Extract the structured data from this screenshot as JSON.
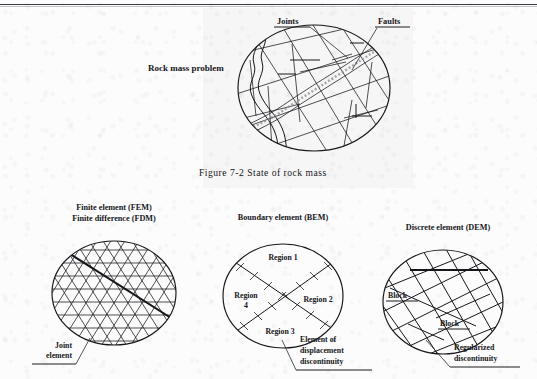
{
  "page": {
    "background": "#fcfcfc",
    "ink": "#17171b",
    "top_rule": true
  },
  "figure_top": {
    "title": "Rock mass problem",
    "callouts": [
      {
        "id": "joints",
        "label": "Joints"
      },
      {
        "id": "faults",
        "label": "Faults"
      }
    ],
    "caption_number": "Figure 7-2",
    "caption_text": "State of rock mass",
    "caption_full": "Figure 7-2    State of rock mass"
  },
  "methods": [
    {
      "id": "fem",
      "heading_lines": [
        "Finite element (FEM)",
        "Finite difference (FDM)"
      ],
      "callouts": [
        {
          "id": "joint-element",
          "lines": [
            "Joint",
            "element"
          ],
          "align": "right"
        }
      ]
    },
    {
      "id": "bem",
      "heading_lines": [
        "Boundary element (BEM)"
      ],
      "regions": [
        "Region 1",
        "Region 2",
        "Region 3",
        "Region",
        "4"
      ],
      "region_labels": [
        {
          "id": "region-1",
          "text": "Region 1"
        },
        {
          "id": "region-2",
          "text": "Region 2"
        },
        {
          "id": "region-3",
          "text": "Region 3"
        },
        {
          "id": "region-4",
          "line1": "Region",
          "line2": "4"
        }
      ],
      "callouts": [
        {
          "id": "element-of-displacement-discontinuity",
          "lines": [
            "Element of",
            "displacement",
            "discontinuity"
          ],
          "align": "left"
        }
      ]
    },
    {
      "id": "dem",
      "heading_lines": [
        "Discrete element (DEM)"
      ],
      "block_labels": [
        {
          "id": "block-upper",
          "text": "Block"
        },
        {
          "id": "block-lower",
          "text": "Block"
        }
      ],
      "callouts": [
        {
          "id": "regularized-discontinuity",
          "lines": [
            "Regularized",
            "discontinuity"
          ],
          "align": "left"
        }
      ]
    }
  ]
}
